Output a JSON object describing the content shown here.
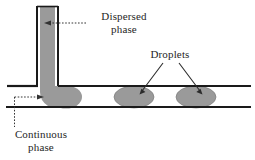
{
  "figure": {
    "type": "microfluidic-t-junction-droplet-diagram",
    "background_color": "#ffffff",
    "stroke_color": "#1a1a1a",
    "fluid_fill_color": "#9a9a9a",
    "fluid_edge_color": "#7d7d7d",
    "text_color": "#262626"
  },
  "labels": {
    "dispersed_phase": {
      "line1": "Dispersed",
      "line2": "phase"
    },
    "droplets": {
      "line1": "Droplets"
    },
    "continuous_phase": {
      "line1": "Continuous",
      "line2": "phase"
    }
  },
  "geometry": {
    "vertical_channel": {
      "left_wall_x": 36,
      "right_wall_x": 59,
      "top_y": 6,
      "bottom_y": 87
    },
    "horizontal_channel": {
      "top_wall_y": 86,
      "bottom_wall_y": 107,
      "left_x": 6,
      "right_x": 251
    },
    "droplets": [
      {
        "cx": 66,
        "cy": 97,
        "rx": 16,
        "ry": 12,
        "name": "forming-droplet-at-junction"
      },
      {
        "cx": 134,
        "cy": 97,
        "rx": 20,
        "ry": 11,
        "name": "droplet-middle"
      },
      {
        "cx": 196,
        "cy": 97,
        "rx": 20,
        "ry": 11,
        "name": "droplet-right"
      }
    ],
    "leaders": {
      "dispersed_phase": {
        "style": "dotted",
        "from_x": 86,
        "from_y": 23,
        "to_x": 48,
        "to_y": 23,
        "arrow_at": "to"
      },
      "continuous_phase_horizontal": {
        "style": "dotted",
        "from_x": 14,
        "from_y": 97,
        "to_x": 40,
        "to_y": 97,
        "arrow_at": "to"
      },
      "continuous_phase_vertical": {
        "style": "dotted",
        "from_x": 14,
        "from_y": 97,
        "to_x": 14,
        "to_y": 126
      },
      "droplets_left_arrow": {
        "style": "solid",
        "from_x": 163,
        "from_y": 63,
        "to_x": 140,
        "to_y": 93,
        "arrow_at": "to"
      },
      "droplets_right_arrow": {
        "style": "solid",
        "from_x": 178,
        "from_y": 63,
        "to_x": 202,
        "to_y": 93,
        "arrow_at": "to"
      }
    }
  }
}
